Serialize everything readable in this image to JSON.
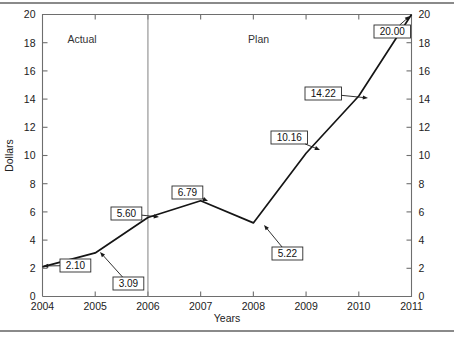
{
  "chart_data": {
    "type": "line",
    "title": "",
    "xlabel": "Years",
    "ylabel": "Dollars",
    "categories": [
      "2004",
      "2005",
      "2006",
      "2007",
      "2008",
      "2009",
      "2010",
      "2011"
    ],
    "x": [
      2004,
      2005,
      2006,
      2007,
      2008,
      2009,
      2010,
      2011
    ],
    "values": [
      2.1,
      3.09,
      5.6,
      6.79,
      5.22,
      10.16,
      14.22,
      20.0
    ],
    "point_labels": [
      "2.10",
      "3.09",
      "5.60",
      "6.79",
      "5.22",
      "10.16",
      "14.22",
      "20.00"
    ],
    "series": [
      {
        "name": "Dollars",
        "values": [
          2.1,
          3.09,
          5.6,
          6.79,
          5.22,
          10.16,
          14.22,
          20.0
        ]
      }
    ],
    "xlim": [
      2004,
      2011
    ],
    "ylim": [
      0,
      20
    ],
    "y_ticks": [
      "0",
      "2",
      "4",
      "6",
      "8",
      "10",
      "12",
      "14",
      "16",
      "18",
      "20"
    ],
    "y_tick_values": [
      0,
      2,
      4,
      6,
      8,
      10,
      12,
      14,
      16,
      18,
      20
    ],
    "x_ticks": [
      "2004",
      "2005",
      "2006",
      "2007",
      "2008",
      "2009",
      "2010",
      "2011"
    ],
    "grid": false,
    "legend": "none",
    "right_axis": {
      "shown": true,
      "ticks": [
        "0",
        "2",
        "4",
        "6",
        "8",
        "10",
        "12",
        "14",
        "16",
        "18",
        "20"
      ],
      "tick_values": [
        0,
        2,
        4,
        6,
        8,
        10,
        12,
        14,
        16,
        18,
        20
      ]
    },
    "annotations": [
      {
        "label": "Actual",
        "x": 2004.75,
        "y": 18.0,
        "kind": "region-label"
      },
      {
        "label": "Plan",
        "x": 2008.1,
        "y": 18.0,
        "kind": "region-label"
      }
    ],
    "divider": {
      "x": 2006,
      "label": "actual-plan-divider"
    }
  },
  "callouts": [
    {
      "text": "2.10",
      "box_x": 60,
      "box_y": 259,
      "tip_x": 43,
      "tip_y": 266
    },
    {
      "text": "3.09",
      "box_x": 113,
      "box_y": 277,
      "tip_x": 100,
      "tip_y": 252
    },
    {
      "text": "5.60",
      "box_x": 111,
      "box_y": 207,
      "tip_x": 159,
      "tip_y": 217
    },
    {
      "text": "6.79",
      "box_x": 172,
      "box_y": 186,
      "tip_x": 208,
      "tip_y": 201
    },
    {
      "text": "5.22",
      "box_x": 272,
      "box_y": 247,
      "tip_x": 264,
      "tip_y": 225
    },
    {
      "text": "10.16",
      "box_x": 271,
      "box_y": 131,
      "tip_x": 320,
      "tip_y": 150
    },
    {
      "text": "14.22",
      "box_x": 305,
      "box_y": 87,
      "tip_x": 368,
      "tip_y": 98
    },
    {
      "text": "20.00",
      "box_x": 374,
      "box_y": 25,
      "tip_x": 410,
      "tip_y": 16
    }
  ],
  "axis_titles": {
    "y": "Dollars",
    "x": "Years"
  }
}
